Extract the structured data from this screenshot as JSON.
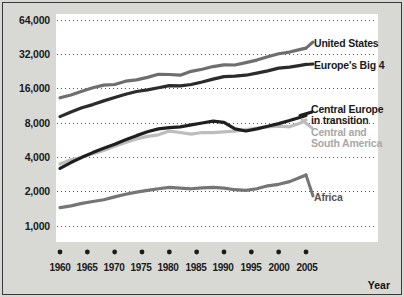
{
  "chart_data": {
    "type": "line",
    "title": "",
    "xlabel": "Year",
    "ylabel": "",
    "yscale": "log2",
    "ylim": [
      1000,
      64000
    ],
    "xlim": [
      1960,
      2005
    ],
    "grid": true,
    "gridstyle": "dotted-horizontal",
    "legend_position": "inline-right",
    "ytick_labels": [
      "64,000",
      "32,000",
      "16,000",
      "8,000",
      "4,000",
      "2,000",
      "1,000"
    ],
    "ytick_values": [
      64000,
      32000,
      16000,
      8000,
      4000,
      2000,
      1000
    ],
    "xtick_labels": [
      "1960",
      "1965",
      "1970",
      "1975",
      "1980",
      "1985",
      "1990",
      "1995",
      "2000",
      "2005"
    ],
    "xtick_values": [
      1960,
      1965,
      1970,
      1975,
      1980,
      1985,
      1990,
      1995,
      2000,
      2005
    ],
    "x": [
      1960,
      1962,
      1964,
      1966,
      1968,
      1970,
      1972,
      1974,
      1976,
      1978,
      1980,
      1982,
      1984,
      1986,
      1988,
      1990,
      1992,
      1994,
      1996,
      1998,
      2000,
      2002,
      2004,
      2005
    ],
    "series": [
      {
        "name": "United States",
        "color": "#6e6e6e",
        "label_color": "#3b3b3b",
        "values": [
          13300,
          14100,
          15200,
          16300,
          17200,
          17400,
          18600,
          19100,
          20100,
          21400,
          21300,
          21000,
          22700,
          23700,
          25000,
          25900,
          25800,
          27100,
          28500,
          30500,
          32400,
          33500,
          35400,
          36300
        ]
      },
      {
        "name": "Europe's Big 4",
        "color": "#2b2b2b",
        "label_color": "#1a1a1a",
        "values": [
          9100,
          10000,
          10900,
          11600,
          12500,
          13400,
          14300,
          15100,
          15600,
          16300,
          17000,
          16900,
          17400,
          18300,
          19400,
          20400,
          20600,
          21000,
          21900,
          22900,
          24200,
          24700,
          25600,
          26100
        ]
      },
      {
        "name": "Central Europe in transition",
        "color": "#1f1f1f",
        "label_color": "#1a1a1a",
        "values": [
          3200,
          3600,
          4000,
          4400,
          4800,
          5200,
          5700,
          6200,
          6700,
          7100,
          7300,
          7400,
          7700,
          8000,
          8300,
          8100,
          7100,
          6800,
          7100,
          7500,
          7900,
          8400,
          9000,
          9300
        ]
      },
      {
        "name": "Central and South America",
        "color": "#bdbdbd",
        "label_color": "#a8a8a8",
        "values": [
          3500,
          3800,
          4000,
          4300,
          4600,
          5000,
          5400,
          5800,
          6100,
          6300,
          6800,
          6600,
          6400,
          6600,
          6600,
          6700,
          6800,
          7000,
          7200,
          7400,
          7500,
          7400,
          8000,
          8500
        ]
      },
      {
        "name": "Africa",
        "color": "#757575",
        "label_color": "#555555",
        "values": [
          1450,
          1500,
          1580,
          1640,
          1700,
          1800,
          1900,
          1980,
          2050,
          2120,
          2180,
          2150,
          2120,
          2160,
          2180,
          2150,
          2080,
          2050,
          2120,
          2250,
          2320,
          2450,
          2680,
          2800
        ]
      }
    ],
    "series_labels": [
      {
        "text": "United States",
        "style": "dark"
      },
      {
        "text": "Europe's Big 4",
        "style": "dark"
      },
      {
        "text": "Central Europe",
        "style": "dark"
      },
      {
        "text": "in transition",
        "style": "dark"
      },
      {
        "text": "Central and",
        "style": "light"
      },
      {
        "text": "South America",
        "style": "light"
      },
      {
        "text": "Africa",
        "style": "mid"
      }
    ]
  },
  "axis": {
    "y": {
      "t64": "64,000",
      "t32": "32,000",
      "t16": "16,000",
      "t8": "8,000",
      "t4": "4,000",
      "t2": "2,000",
      "t1": "1,000"
    },
    "x": {
      "t1960": "1960",
      "t1965": "1965",
      "t1970": "1970",
      "t1975": "1975",
      "t1980": "1980",
      "t1985": "1985",
      "t1990": "1990",
      "t1995": "1995",
      "t2000": "2000",
      "t2005": "2005",
      "title": "Year"
    }
  },
  "labels": {
    "united_states": "United States",
    "europe_big4": "Europe's Big 4",
    "central_europe_1": "Central Europe",
    "central_europe_2": "in transition",
    "central_south_1": "Central and",
    "central_south_2": "South America",
    "africa": "Africa"
  },
  "colors": {
    "background": "#d8d8d4",
    "panel": "#ffffff",
    "frame": "#3a3a3a",
    "grid": "#555555",
    "us_line": "#6e6e6e",
    "eu_line": "#2b2b2b",
    "ce_line": "#1f1f1f",
    "csa_line": "#bdbdbd",
    "africa_line": "#757575"
  }
}
